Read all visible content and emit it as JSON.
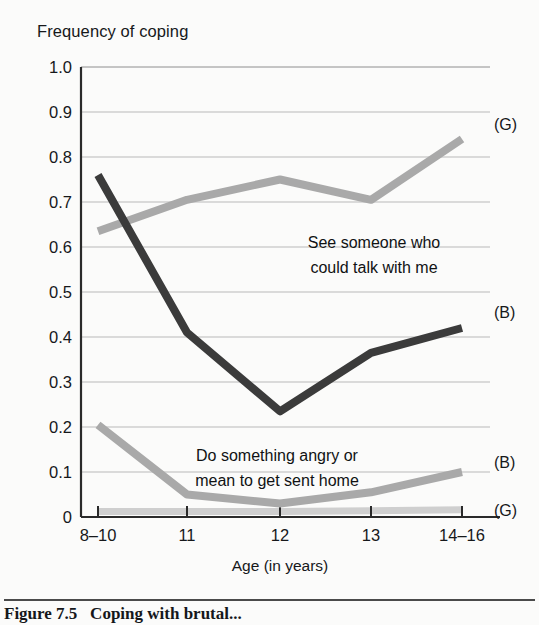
{
  "figure": {
    "title": "Frequency of coping",
    "caption_label": "Figure 7.5",
    "caption_text": "Coping with brutal..."
  },
  "chart_data": {
    "type": "line",
    "title": "Frequency of coping",
    "xlabel": "Age (in years)",
    "ylabel": "Frequency of coping",
    "categories": [
      "8–10",
      "11",
      "12",
      "13",
      "14–16"
    ],
    "ylim": [
      0,
      1.0
    ],
    "ytick_labels": [
      "0",
      "0.1",
      "0.2",
      "0.3",
      "0.4",
      "0.5",
      "0.6",
      "0.7",
      "0.8",
      "0.9",
      "1.0"
    ],
    "ytick_values": [
      0,
      0.1,
      0.2,
      0.3,
      0.4,
      0.5,
      0.6,
      0.7,
      0.8,
      0.9,
      1.0
    ],
    "grid": true,
    "legend_position": "inline-right",
    "series": [
      {
        "name": "See someone who could talk with me (G)",
        "tag": "(G)",
        "color": "#a9a9a9",
        "values": [
          0.635,
          0.705,
          0.75,
          0.705,
          0.84
        ]
      },
      {
        "name": "See someone who could talk with me (B)",
        "tag": "(B)",
        "color": "#3b3b3b",
        "values": [
          0.76,
          0.41,
          0.235,
          0.365,
          0.42
        ]
      },
      {
        "name": "Do something angry or mean to get sent home (B)",
        "tag": "(B)",
        "color": "#a9a9a9",
        "values": [
          0.205,
          0.05,
          0.03,
          0.055,
          0.1
        ]
      },
      {
        "name": "Do something angry or mean to get sent home (G)",
        "tag": "(G)",
        "color": "#cfcfcf",
        "values": [
          0.012,
          0.012,
          0.012,
          0.014,
          0.016
        ]
      }
    ],
    "annotations": [
      {
        "id": "annot-talk",
        "lines": [
          "See someone who",
          "could talk with me"
        ]
      },
      {
        "id": "annot-angry",
        "lines": [
          "Do something angry or",
          "mean to get sent home"
        ]
      }
    ]
  },
  "ticks": {
    "y": {
      "t0": "0",
      "t1": "0.1",
      "t2": "0.2",
      "t3": "0.3",
      "t4": "0.4",
      "t5": "0.5",
      "t6": "0.6",
      "t7": "0.7",
      "t8": "0.8",
      "t9": "0.9",
      "t10": "1.0"
    },
    "x": {
      "x0": "8–10",
      "x1": "11",
      "x2": "12",
      "x3": "13",
      "x4": "14–16"
    }
  },
  "axis": {
    "x_title": "Age (in years)"
  },
  "tags": {
    "g_top": "(G)",
    "b_mid": "(B)",
    "b_low": "(B)",
    "g_bottom": "(G)"
  },
  "annotations": {
    "talk_line1": "See someone who",
    "talk_line2": "could talk with me",
    "angry_line1": "Do something angry or",
    "angry_line2": "mean to get sent home"
  }
}
